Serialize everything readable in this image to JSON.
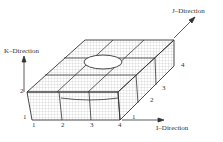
{
  "diagram": {
    "axes": {
      "k": "K–Direction",
      "j": "J–Direction",
      "i": "I–Direction"
    },
    "i_indices": [
      "1",
      "2",
      "3",
      "4"
    ],
    "j_indices": [
      "1",
      "2",
      "3",
      "4"
    ],
    "k_indices": [
      "1",
      "2"
    ],
    "colors": {
      "line": "#333333",
      "grid": "#9a9a9a",
      "background": "#ffffff"
    }
  }
}
